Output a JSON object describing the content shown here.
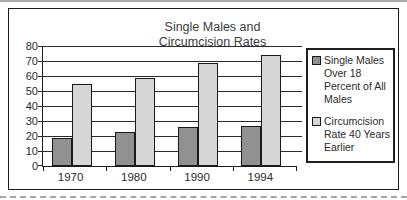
{
  "chart_data": {
    "type": "bar",
    "title": "Single Males and Circumcision Rates",
    "title_lines": [
      "Single Males and",
      "Circumcision Rates"
    ],
    "categories": [
      "1970",
      "1980",
      "1990",
      "1994"
    ],
    "series": [
      {
        "name": "Single Males Over 18 Percent of All Males",
        "label_lines": [
          "Single Males",
          "Over 18",
          "Percent of All",
          "Males"
        ],
        "color": "#919191",
        "values": [
          19,
          23,
          26,
          27
        ]
      },
      {
        "name": "Circumcision Rate 40 Years Earlier",
        "label_lines": [
          "Circumcision",
          "Rate 40 Years",
          "Earlier"
        ],
        "color": "#d6d6d6",
        "values": [
          55,
          59,
          69,
          74
        ]
      }
    ],
    "ylim": [
      0,
      80
    ],
    "yticks": [
      80,
      70,
      60,
      50,
      40,
      30,
      20,
      10,
      0
    ],
    "grid": true,
    "legend_position": "right",
    "colors": {
      "axis": "#1a1a1a",
      "gridline": "#2a2a2a",
      "bar_border": "#1a1a1a",
      "frame_border": "#1a1a1a"
    }
  }
}
